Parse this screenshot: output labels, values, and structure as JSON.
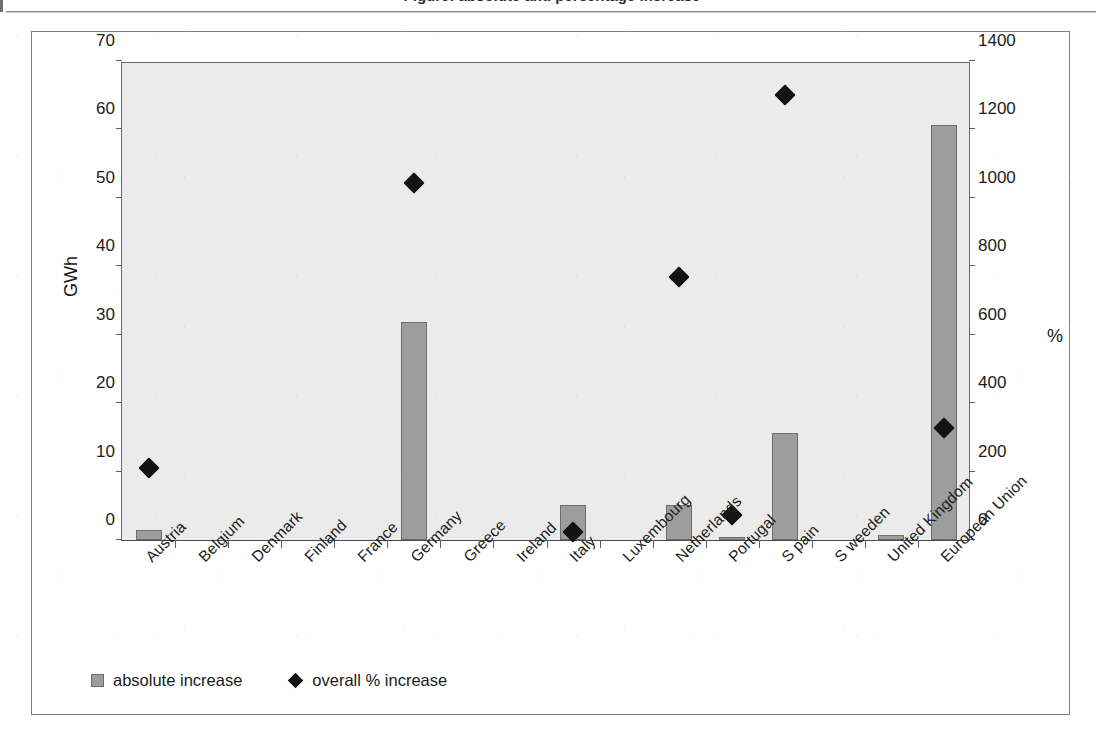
{
  "page": {
    "partial_title_top": "Figure: absolute and percentage increase",
    "left_margin_tick": "page-edge-mark"
  },
  "legend": {
    "items": [
      {
        "label": "absolute increase",
        "marker": "square-swatch",
        "color": "#9d9d9d"
      },
      {
        "label": "overall % increase",
        "marker": "diamond-swatch",
        "color": "#131313"
      }
    ]
  },
  "chart_data": {
    "type": "bar",
    "title": "",
    "xlabel": "",
    "ylabel": "GWh",
    "y2label": "%",
    "ylim": [
      0,
      70
    ],
    "y2lim": [
      0,
      1400
    ],
    "yticks": [
      "0",
      "10",
      "20",
      "30",
      "40",
      "50",
      "60",
      "70"
    ],
    "y2ticks": [
      "0",
      "200",
      "400",
      "600",
      "800",
      "1000",
      "1200",
      "1400"
    ],
    "grid": false,
    "legend_position": "bottom-left",
    "plot_background": "#ebebeb",
    "categories": [
      "Austria",
      "Belgium",
      "Denmark",
      "Finland",
      "France",
      "Germany",
      "Greece",
      "Ireland",
      "Italy",
      "Luxembourg",
      "Netherlands",
      "Portugal",
      "S pain",
      "S weeden",
      "United Kingdom",
      "European Union"
    ],
    "series": [
      {
        "name": "absolute increase",
        "axis": "left",
        "unit": "GWh",
        "type": "bar",
        "color": "#9d9d9d",
        "values": [
          1.4,
          0,
          0,
          0,
          0,
          31.9,
          0,
          0,
          5.1,
          0,
          5.1,
          0.35,
          15.6,
          0,
          0.7,
          60.6
        ]
      },
      {
        "name": "overall % increase",
        "axis": "right",
        "unit": "%",
        "type": "scatter",
        "color": "#131313",
        "values": [
          232,
          null,
          null,
          null,
          null,
          1064,
          null,
          null,
          44,
          null,
          792,
          96,
          1324,
          null,
          null,
          350
        ]
      }
    ]
  }
}
